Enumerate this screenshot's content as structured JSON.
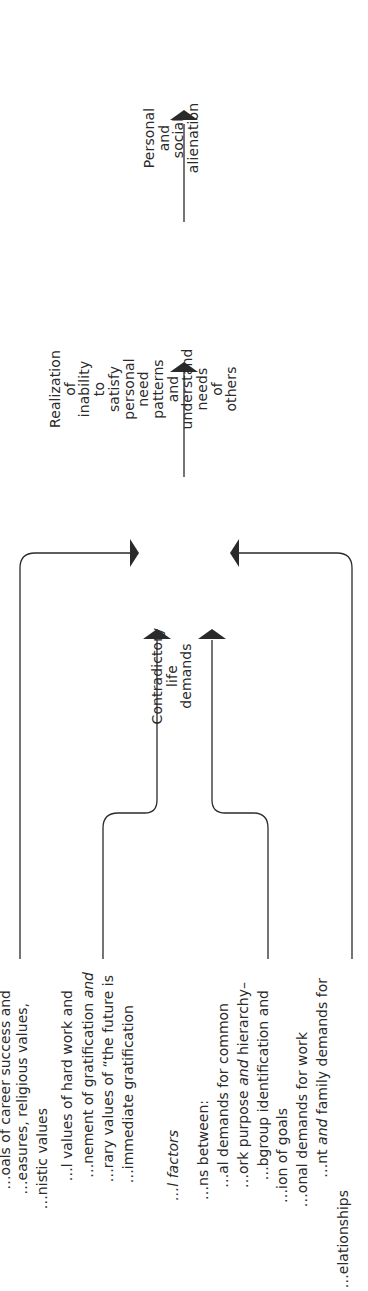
{
  "diagram": {
    "orientation": "rotated 90° counter-clockwise (text reads bottom-to-top)",
    "nodes": {
      "alienation": {
        "lines": [
          "Personal",
          "and",
          "social",
          "alienation"
        ]
      },
      "realization": {
        "lines": [
          "Realization",
          "of",
          "inability",
          "to",
          "satisfy",
          "personal",
          "need",
          "patterns",
          "and",
          "understand",
          "needs",
          "of",
          "others"
        ]
      },
      "contradictory": {
        "lines": [
          "Contradictory",
          "life",
          "demands"
        ]
      }
    },
    "source_text": {
      "lines": [
        {
          "x": 5,
          "end_y": 990,
          "text": "…oals of career success and"
        },
        {
          "x": 22,
          "end_y": 1003,
          "text": "…easures, religious values,"
        },
        {
          "x": 42,
          "end_y": 1108,
          "text": "…nistic values"
        },
        {
          "x": 67,
          "end_y": 990,
          "text": "…l values of hard work and"
        },
        {
          "x": 88,
          "end_y": 972,
          "text_parts": [
            "…nement of gratification ",
            {
              "i": "and"
            }
          ]
        },
        {
          "x": 108,
          "end_y": 975,
          "text": "…rary values of “the future is"
        },
        {
          "x": 128,
          "end_y": 1005,
          "text": "…immediate gratification"
        },
        {
          "x": 173,
          "end_y": 1130,
          "text_parts": [
            {
              "i": "…l factors"
            }
          ]
        },
        {
          "x": 203,
          "end_y": 1100,
          "text": "…ns between:"
        },
        {
          "x": 223,
          "end_y": 1003,
          "text": "…al demands for common"
        },
        {
          "x": 243,
          "end_y": 982,
          "text_parts": [
            "…ork purpose ",
            {
              "i": "and"
            },
            " hierarchy–"
          ]
        },
        {
          "x": 263,
          "end_y": 990,
          "text": "…bgroup identification and"
        },
        {
          "x": 282,
          "end_y": 1108,
          "text": "…ion of goals"
        },
        {
          "x": 302,
          "end_y": 1032,
          "text": "…onal demands for work"
        },
        {
          "x": 322,
          "end_y": 978,
          "text_parts": [
            "…nt ",
            {
              "i": "and"
            },
            " family demands for"
          ]
        },
        {
          "x": 343,
          "end_y": 1190,
          "text": "…elationships"
        }
      ]
    },
    "colors": {
      "line": "#2a2a2a",
      "text": "#2a2a2a",
      "background": "#ffffff"
    }
  }
}
